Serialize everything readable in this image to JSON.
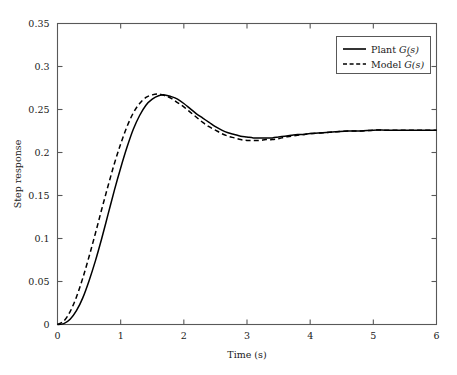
{
  "chart_data": {
    "type": "line",
    "title": "",
    "subtitle": "",
    "xlabel": "Time (s)",
    "ylabel": "Step response",
    "xlim": [
      0,
      6
    ],
    "ylim": [
      0,
      0.35
    ],
    "grid": false,
    "legend_position": "top-right",
    "x_ticks": [
      0,
      1,
      2,
      3,
      4,
      5,
      6
    ],
    "x_tick_labels": [
      "0",
      "1",
      "2",
      "3",
      "4",
      "5",
      "6"
    ],
    "y_ticks": [
      0,
      0.05,
      0.1,
      0.15,
      0.2,
      0.25,
      0.3,
      0.35
    ],
    "y_tick_labels": [
      "0",
      "0.05",
      "0.1",
      "0.15",
      "0.2",
      "0.25",
      "0.3",
      "0.35"
    ],
    "annotations": [],
    "series": [
      {
        "name": "Plant G(s)",
        "style": "solid",
        "color": "#000000",
        "x": [
          0.0,
          0.1,
          0.2,
          0.3,
          0.4,
          0.5,
          0.6,
          0.7,
          0.8,
          0.9,
          1.0,
          1.1,
          1.2,
          1.3,
          1.4,
          1.5,
          1.6,
          1.7,
          1.8,
          1.9,
          2.0,
          2.1,
          2.2,
          2.3,
          2.4,
          2.5,
          2.6,
          2.7,
          2.8,
          2.9,
          3.0,
          3.1,
          3.2,
          3.3,
          3.4,
          3.5,
          3.6,
          3.7,
          3.8,
          3.9,
          4.0,
          4.2,
          4.4,
          4.6,
          4.8,
          5.0,
          5.2,
          5.4,
          5.6,
          5.8,
          6.0
        ],
        "y": [
          0.0,
          0.001,
          0.006,
          0.016,
          0.031,
          0.051,
          0.074,
          0.1,
          0.128,
          0.156,
          0.182,
          0.206,
          0.227,
          0.243,
          0.255,
          0.262,
          0.266,
          0.267,
          0.265,
          0.262,
          0.257,
          0.251,
          0.245,
          0.24,
          0.235,
          0.23,
          0.226,
          0.223,
          0.221,
          0.219,
          0.218,
          0.217,
          0.217,
          0.217,
          0.217,
          0.218,
          0.219,
          0.22,
          0.221,
          0.221,
          0.222,
          0.223,
          0.224,
          0.225,
          0.225,
          0.226,
          0.226,
          0.226,
          0.226,
          0.226,
          0.226
        ]
      },
      {
        "name": "Model Ĝ(s)",
        "style": "dashed",
        "color": "#000000",
        "x": [
          0.0,
          0.1,
          0.2,
          0.3,
          0.4,
          0.5,
          0.6,
          0.7,
          0.8,
          0.9,
          1.0,
          1.1,
          1.2,
          1.3,
          1.4,
          1.5,
          1.6,
          1.7,
          1.8,
          1.9,
          2.0,
          2.1,
          2.2,
          2.3,
          2.4,
          2.5,
          2.6,
          2.7,
          2.8,
          2.9,
          3.0,
          3.1,
          3.2,
          3.3,
          3.4,
          3.5,
          3.6,
          3.7,
          3.8,
          3.9,
          4.0,
          4.2,
          4.4,
          4.6,
          4.8,
          5.0,
          5.2,
          5.4,
          5.6,
          5.8,
          6.0
        ],
        "y": [
          0.0,
          0.004,
          0.015,
          0.032,
          0.054,
          0.079,
          0.106,
          0.134,
          0.161,
          0.187,
          0.21,
          0.23,
          0.246,
          0.257,
          0.264,
          0.267,
          0.268,
          0.266,
          0.263,
          0.258,
          0.253,
          0.247,
          0.241,
          0.235,
          0.23,
          0.226,
          0.222,
          0.219,
          0.217,
          0.215,
          0.214,
          0.214,
          0.214,
          0.215,
          0.215,
          0.216,
          0.218,
          0.219,
          0.22,
          0.221,
          0.222,
          0.223,
          0.224,
          0.225,
          0.225,
          0.226,
          0.226,
          0.226,
          0.226,
          0.226,
          0.226
        ]
      }
    ]
  },
  "legend": {
    "entries": [
      {
        "prefix": "Plant ",
        "symbol": "G",
        "suffix": "(s)",
        "hat": false
      },
      {
        "prefix": "Model ",
        "symbol": "G",
        "suffix": "(s)",
        "hat": true
      }
    ]
  },
  "colors": {
    "axis": "#585858",
    "curve": "#000000",
    "background": "#ffffff",
    "text": "#1a1a1a"
  }
}
